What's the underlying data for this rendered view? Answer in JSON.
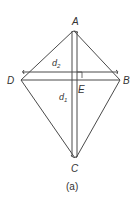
{
  "figure": {
    "caption": "(a)",
    "shape": "kite",
    "line_color": "#4a4a4a",
    "label_color": "#333333"
  },
  "vertices": {
    "A": {
      "label": "A",
      "x": 74,
      "y": 31
    },
    "B": {
      "label": "B",
      "x": 120,
      "y": 80
    },
    "C": {
      "label": "C",
      "x": 75,
      "y": 158
    },
    "D": {
      "label": "D",
      "x": 21,
      "y": 80
    }
  },
  "intersection": {
    "label": "E",
    "x": 75,
    "y": 80
  },
  "diagonals": {
    "d1": {
      "label": "d",
      "subscript": "1",
      "description": "vertical diagonal AC"
    },
    "d2": {
      "label": "d",
      "subscript": "2",
      "description": "horizontal diagonal DB"
    }
  }
}
